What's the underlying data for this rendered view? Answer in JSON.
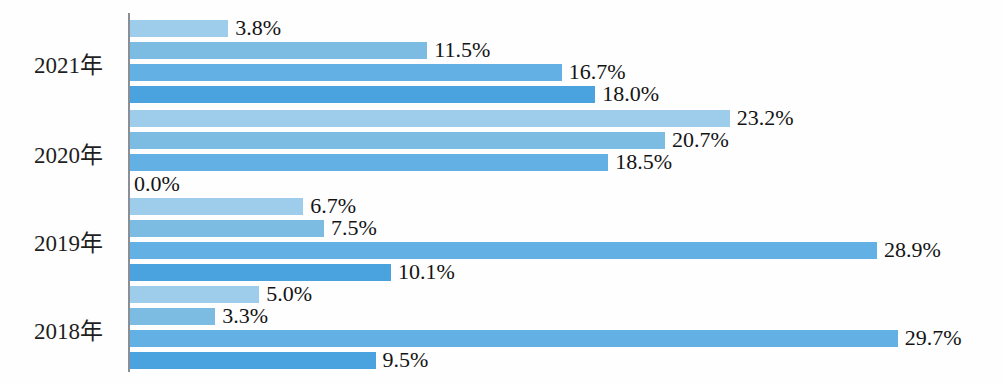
{
  "chart_data": {
    "type": "bar",
    "orientation": "horizontal",
    "title": "",
    "subtitle": "",
    "xlabel": "",
    "ylabel": "",
    "categories": [
      "2021年",
      "2020年",
      "2019年",
      "2018年"
    ],
    "series": [
      {
        "name": "series-1",
        "color": "#9dcdeb",
        "values": [
          3.8,
          23.2,
          6.7,
          5.0
        ],
        "labels": [
          "3.8%",
          "23.2%",
          "6.7%",
          "5.0%"
        ]
      },
      {
        "name": "series-2",
        "color": "#7cbce3",
        "values": [
          11.5,
          20.7,
          7.5,
          3.3
        ],
        "labels": [
          "11.5%",
          "20.7%",
          "7.5%",
          "3.3%"
        ]
      },
      {
        "name": "series-3",
        "color": "#63b1e4",
        "values": [
          16.7,
          18.5,
          28.9,
          29.7
        ],
        "labels": [
          "16.7%",
          "18.5%",
          "28.9%",
          "29.7%"
        ]
      },
      {
        "name": "series-4",
        "color": "#4aa3de",
        "values": [
          18.0,
          0.0,
          10.1,
          9.5
        ],
        "labels": [
          "18.0%",
          "0.0%",
          "10.1%",
          "9.5%"
        ]
      }
    ],
    "xlim": [
      0,
      33
    ],
    "grid": false,
    "legend": "none",
    "axis_color": "#8a8f96",
    "value_suffix": "%"
  },
  "groups": [
    {
      "year": "2021年",
      "bars": [
        {
          "label": "3.8%",
          "value": 3.8,
          "color": "#9dcdeb"
        },
        {
          "label": "11.5%",
          "value": 11.5,
          "color": "#7cbce3"
        },
        {
          "label": "16.7%",
          "value": 16.7,
          "color": "#63b1e4"
        },
        {
          "label": "18.0%",
          "value": 18.0,
          "color": "#4aa3de"
        }
      ]
    },
    {
      "year": "2020年",
      "bars": [
        {
          "label": "23.2%",
          "value": 23.2,
          "color": "#9dcdeb"
        },
        {
          "label": "20.7%",
          "value": 20.7,
          "color": "#7cbce3"
        },
        {
          "label": "18.5%",
          "value": 18.5,
          "color": "#63b1e4"
        },
        {
          "label": "0.0%",
          "value": 0.0,
          "color": "#4aa3de"
        }
      ]
    },
    {
      "year": "2019年",
      "bars": [
        {
          "label": "6.7%",
          "value": 6.7,
          "color": "#9dcdeb"
        },
        {
          "label": "7.5%",
          "value": 7.5,
          "color": "#7cbce3"
        },
        {
          "label": "28.9%",
          "value": 28.9,
          "color": "#63b1e4"
        },
        {
          "label": "10.1%",
          "value": 10.1,
          "color": "#4aa3de"
        }
      ]
    },
    {
      "year": "2018年",
      "bars": [
        {
          "label": "5.0%",
          "value": 5.0,
          "color": "#9dcdeb"
        },
        {
          "label": "3.3%",
          "value": 3.3,
          "color": "#7cbce3"
        },
        {
          "label": "29.7%",
          "value": 29.7,
          "color": "#63b1e4"
        },
        {
          "label": "9.5%",
          "value": 9.5,
          "color": "#4aa3de"
        }
      ]
    }
  ],
  "layout": {
    "axis_x": 128,
    "axis_top": 13,
    "axis_bottom": 372,
    "px_per_percent": 25.85,
    "bar_height": 17,
    "bar_gap": 5,
    "group_tops": [
      20,
      110,
      198,
      286
    ]
  }
}
